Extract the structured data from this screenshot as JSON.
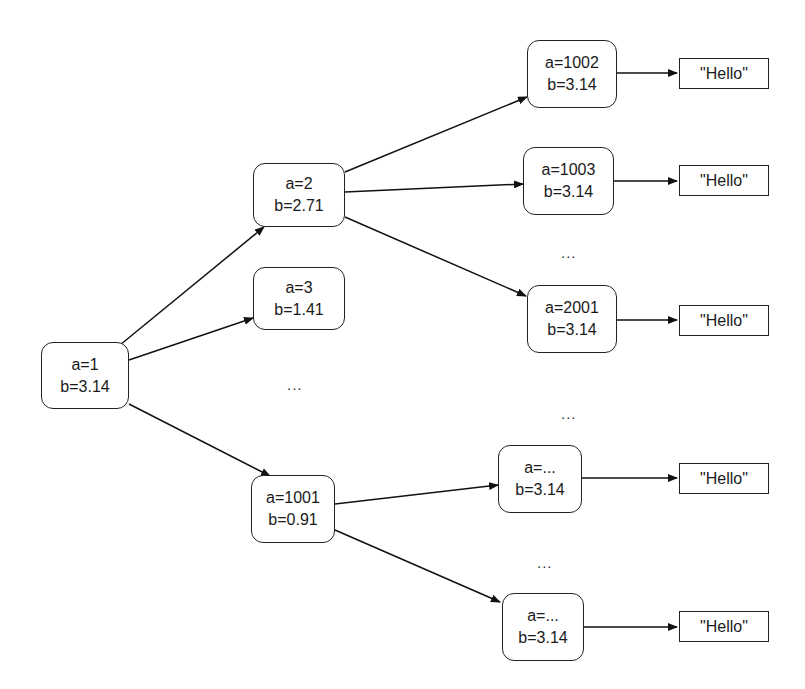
{
  "diagram": {
    "type": "tree",
    "nodes": [
      {
        "id": "n1",
        "a": "a=1",
        "b": "b=3.14"
      },
      {
        "id": "n2",
        "a": "a=2",
        "b": "b=2.71"
      },
      {
        "id": "n3",
        "a": "a=3",
        "b": "b=1.41"
      },
      {
        "id": "n1001",
        "a": "a=1001",
        "b": "b=0.91"
      },
      {
        "id": "n1002",
        "a": "a=1002",
        "b": "b=3.14"
      },
      {
        "id": "n1003",
        "a": "a=1003",
        "b": "b=3.14"
      },
      {
        "id": "n2001",
        "a": "a=2001",
        "b": "b=3.14"
      },
      {
        "id": "nx1",
        "a": "a=...",
        "b": "b=3.14"
      },
      {
        "id": "nx2",
        "a": "a=...",
        "b": "b=3.14"
      }
    ],
    "values": [
      "\"Hello\"",
      "\"Hello\"",
      "\"Hello\"",
      "\"Hello\"",
      "\"Hello\""
    ],
    "ellipses": [
      "...",
      "...",
      "...",
      "..."
    ],
    "edges": [
      [
        "n1",
        "n2"
      ],
      [
        "n1",
        "n3"
      ],
      [
        "n1",
        "n1001"
      ],
      [
        "n2",
        "n1002"
      ],
      [
        "n2",
        "n1003"
      ],
      [
        "n2",
        "n2001"
      ],
      [
        "n1001",
        "nx1"
      ],
      [
        "n1001",
        "nx2"
      ],
      [
        "n1002",
        "v0"
      ],
      [
        "n1003",
        "v1"
      ],
      [
        "n2001",
        "v2"
      ],
      [
        "nx1",
        "v3"
      ],
      [
        "nx2",
        "v4"
      ]
    ]
  }
}
